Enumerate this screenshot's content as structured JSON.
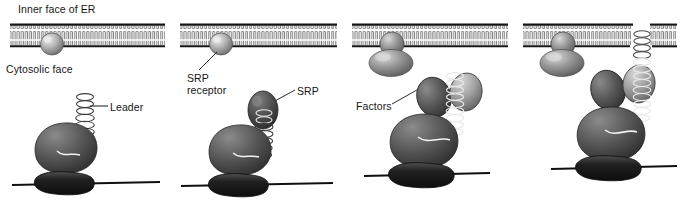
{
  "figure": {
    "title_visible": false,
    "type": "biological-process-diagram",
    "panel_count": 4,
    "colors": {
      "membrane_line": "#141414",
      "lipid_tail": "#6b6b6b",
      "ribosome_large_subunit": "#555555",
      "ribosome_small_subunit": "#2b2b2b",
      "srp": "#4a4a4a",
      "srp_receptor": "#9a9a9a",
      "translocon": "#808080",
      "factor": "#5a5a5a",
      "nascent_chain": "#ffffff",
      "background": "#ffffff",
      "label_text": "#151515"
    }
  },
  "panels": [
    {
      "id": "panel-1",
      "order": 1,
      "labels": [
        {
          "name": "inner-face-of-er-label",
          "text": "Inner face of ER"
        },
        {
          "name": "cytosolic-face-label",
          "text": "Cytosolic face"
        },
        {
          "name": "leader-label",
          "text": "Leader"
        }
      ],
      "elements": [
        "er-membrane",
        "srp-receptor",
        "ribosome-large-subunit",
        "ribosome-small-subunit",
        "mrna-strand",
        "nascent-chain-helix"
      ]
    },
    {
      "id": "panel-2",
      "order": 2,
      "labels": [
        {
          "name": "srp-receptor-label",
          "text": "SRP\nreceptor"
        },
        {
          "name": "srp-label",
          "text": "SRP"
        }
      ],
      "elements": [
        "er-membrane",
        "srp-receptor",
        "srp",
        "ribosome-large-subunit",
        "ribosome-small-subunit",
        "mrna-strand",
        "nascent-chain-helix"
      ]
    },
    {
      "id": "panel-3",
      "order": 3,
      "labels": [
        {
          "name": "factors-label",
          "text": "Factors"
        }
      ],
      "elements": [
        "er-membrane",
        "srp-receptor-docked",
        "translocon",
        "factor-subunit",
        "ribosome-large-subunit",
        "ribosome-small-subunit",
        "mrna-strand",
        "nascent-chain-helix"
      ]
    },
    {
      "id": "panel-4",
      "order": 4,
      "labels": [],
      "elements": [
        "er-membrane-with-pore",
        "srp-receptor-docked",
        "translocon",
        "factor-subunit",
        "ribosome-large-subunit",
        "ribosome-small-subunit",
        "mrna-strand",
        "nascent-chain-helix-translocating"
      ]
    }
  ],
  "label_text": {
    "inner_face_of_er": "Inner face of ER",
    "cytosolic_face": "Cytosolic face",
    "leader": "Leader",
    "srp_receptor_line1": "SRP",
    "srp_receptor_line2": "receptor",
    "srp": "SRP",
    "factors": "Factors"
  }
}
